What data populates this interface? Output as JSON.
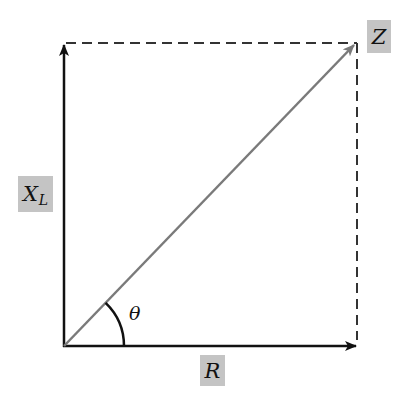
{
  "diagram": {
    "type": "impedance-triangle",
    "colors": {
      "axis": "#111111",
      "resultant": "#7a7a7a",
      "dashed": "#333333",
      "label_bg": "#c4c4c4"
    },
    "labels": {
      "vertical": {
        "main": "X",
        "sub": "L"
      },
      "horizontal": "R",
      "resultant": "Z",
      "angle": "θ"
    }
  }
}
